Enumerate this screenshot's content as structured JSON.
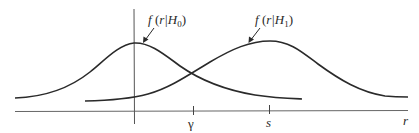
{
  "diagram": {
    "type": "probability-density-functions",
    "curves": [
      {
        "id": "h0",
        "label_func": "f",
        "label_arg": "r|H",
        "label_sub": "0",
        "peak_x_label": "0"
      },
      {
        "id": "h1",
        "label_func": "f",
        "label_arg": "r|H",
        "label_sub": "1",
        "peak_x_label": "s"
      }
    ],
    "axis": {
      "x_label": "r",
      "ticks": [
        {
          "label": "γ"
        },
        {
          "label": "s"
        }
      ]
    },
    "colors": {
      "curve": "#2a2a2a",
      "axis": "#555555",
      "background": "#ffffff"
    }
  }
}
